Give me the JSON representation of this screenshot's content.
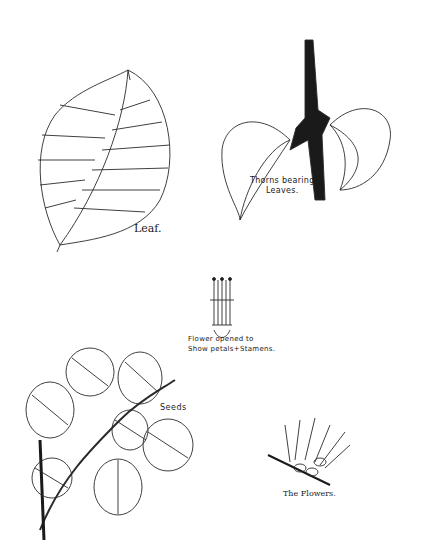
{
  "plate": {
    "background": "#ffffff",
    "ink": "#1a1a1a"
  },
  "labels": {
    "leaf": "Leaf.",
    "thorns_line1": "Thorns bearing",
    "thorns_line2": "Leaves.",
    "flower_line1": "Flower opened to",
    "flower_line2": "Show petals+Stamens.",
    "seeds": "Seeds",
    "flowers": "The Flowers."
  }
}
